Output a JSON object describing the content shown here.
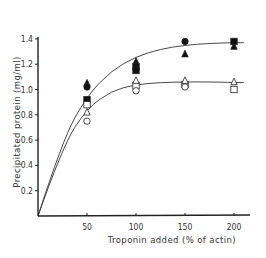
{
  "chart_data": {
    "type": "scatter",
    "title": "",
    "xlabel": "Troponin added (% of actin)",
    "ylabel": "Precipitated protein (mg/ml)",
    "xlim": [
      0,
      225
    ],
    "ylim": [
      0,
      1.55
    ],
    "xticks": [
      50,
      100,
      150,
      200
    ],
    "yticks": [
      0.2,
      0.4,
      0.6,
      0.8,
      1.0,
      1.2,
      1.4
    ],
    "xtick_labels": [
      "50",
      "100",
      "150",
      "200"
    ],
    "ytick_labels": [
      "0.2",
      "0.4",
      "0.6",
      "0.8",
      "1.0",
      "1.2",
      "1.4"
    ],
    "grid": false,
    "legend": null,
    "series": [
      {
        "name": "filled triangle",
        "marker": "triangle",
        "filled": true,
        "x": [
          50,
          100,
          150,
          200
        ],
        "y": [
          1.05,
          1.22,
          1.28,
          1.34
        ]
      },
      {
        "name": "filled circle",
        "marker": "circle",
        "filled": true,
        "x": [
          50,
          150
        ],
        "y": [
          1.02,
          1.38
        ]
      },
      {
        "name": "filled square",
        "marker": "square",
        "filled": true,
        "x": [
          50,
          100,
          100,
          200
        ],
        "y": [
          0.92,
          1.18,
          1.15,
          1.38
        ]
      },
      {
        "name": "open square",
        "marker": "square",
        "filled": false,
        "x": [
          50,
          100,
          150,
          200
        ],
        "y": [
          0.88,
          1.03,
          1.04,
          1.0
        ]
      },
      {
        "name": "open triangle",
        "marker": "triangle",
        "filled": false,
        "x": [
          50,
          100,
          150,
          200
        ],
        "y": [
          0.82,
          1.07,
          1.07,
          1.06
        ]
      },
      {
        "name": "open circle",
        "marker": "circle",
        "filled": false,
        "x": [
          50,
          100,
          150
        ],
        "y": [
          0.75,
          0.99,
          1.02
        ]
      }
    ],
    "fit_curves": [
      {
        "name": "upper saturation curve (filled symbols)",
        "x": [
          0,
          25,
          50,
          75,
          100,
          125,
          150,
          175,
          200,
          210
        ],
        "y": [
          0,
          0.6,
          0.95,
          1.15,
          1.26,
          1.32,
          1.35,
          1.365,
          1.37,
          1.37
        ]
      },
      {
        "name": "lower saturation curve (open symbols)",
        "x": [
          0,
          25,
          50,
          75,
          100,
          125,
          150,
          175,
          200,
          210
        ],
        "y": [
          0,
          0.55,
          0.85,
          0.99,
          1.04,
          1.055,
          1.06,
          1.06,
          1.055,
          1.055
        ]
      }
    ]
  }
}
